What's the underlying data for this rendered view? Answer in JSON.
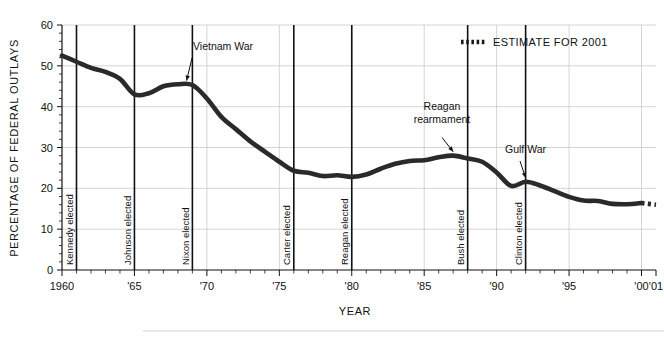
{
  "chart_data": {
    "type": "line",
    "title": "",
    "xlabel": "YEAR",
    "ylabel": "PERCENTAGE OF FEDERAL OUTLAYS",
    "xlim": [
      1960,
      2001
    ],
    "ylim": [
      0,
      60
    ],
    "grid": true,
    "y_ticks": [
      0,
      10,
      20,
      30,
      40,
      50,
      60
    ],
    "y_tick_labels": [
      "0",
      "10",
      "20",
      "30",
      "40",
      "50",
      "60"
    ],
    "x_ticks": [
      1960,
      1965,
      1970,
      1975,
      1980,
      1985,
      1990,
      1995,
      2000,
      2001
    ],
    "x_tick_labels": [
      "1960",
      "'65",
      "'70",
      "'75",
      "'80",
      "'85",
      "'90",
      "'95",
      "'00",
      "'01"
    ],
    "series": [
      {
        "name": "Defense share of federal outlays",
        "x": [
          1960,
          1961,
          1962,
          1963,
          1964,
          1965,
          1966,
          1967,
          1968,
          1969,
          1970,
          1971,
          1972,
          1973,
          1974,
          1975,
          1976,
          1977,
          1978,
          1979,
          1980,
          1981,
          1982,
          1983,
          1984,
          1985,
          1986,
          1987,
          1988,
          1989,
          1990,
          1991,
          1992,
          1993,
          1994,
          1995,
          1996,
          1997,
          1998,
          1999,
          2000
        ],
        "values": [
          52.5,
          51.0,
          49.5,
          48.5,
          46.8,
          43.0,
          43.3,
          45.0,
          45.5,
          45.3,
          42.0,
          37.5,
          34.5,
          31.5,
          29.0,
          26.5,
          24.3,
          23.8,
          23.0,
          23.2,
          22.8,
          23.4,
          24.8,
          26.0,
          26.7,
          26.9,
          27.6,
          28.0,
          27.3,
          26.5,
          23.9,
          20.6,
          21.6,
          20.7,
          19.3,
          17.9,
          17.0,
          16.9,
          16.2,
          16.1,
          16.4
        ]
      },
      {
        "name": "Estimate for 2001",
        "x": [
          2000,
          2001
        ],
        "values": [
          16.4,
          16.0
        ],
        "style": "dotted"
      }
    ],
    "event_lines": [
      {
        "label": "Kennedy elected",
        "x": 1961.0
      },
      {
        "label": "Johnson elected",
        "x": 1965.0
      },
      {
        "label": "Nixon elected",
        "x": 1969.0
      },
      {
        "label": "Carter elected",
        "x": 1976.0
      },
      {
        "label": "Reagan elected",
        "x": 1980.0
      },
      {
        "label": "Bush elected",
        "x": 1988.0
      },
      {
        "label": "Clinton elected",
        "x": 1992.0
      }
    ],
    "annotations": [
      {
        "text": "Vietnam War",
        "lines": [
          "Vietnam War"
        ],
        "point_x": 1968.6,
        "point_y": 45.4
      },
      {
        "text": "Reagan rearmament",
        "lines": [
          "Reagan",
          "rearmament"
        ],
        "point_x": 1987.0,
        "point_y": 28.0
      },
      {
        "text": "Gulf War",
        "lines": [
          "Gulf War"
        ],
        "point_x": 1992.0,
        "point_y": 21.6
      }
    ],
    "legend": {
      "position": "top-right",
      "entries": [
        {
          "label": "ESTIMATE FOR 2001",
          "style": "dotted"
        }
      ]
    }
  }
}
